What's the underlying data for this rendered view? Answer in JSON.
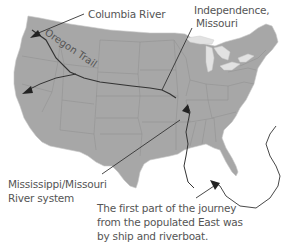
{
  "map": {
    "subject": "Contiguous United States",
    "colors": {
      "land": "#a7a7a7",
      "state_border": "#8e8e8e",
      "lakes": "#e2e2e2",
      "route_line": "#333333",
      "text": "#555555",
      "background": "#ffffff"
    }
  },
  "labels": {
    "columbia_river": "Columbia River",
    "independence_line1": "Independence,",
    "independence_line2": "Missouri",
    "oregon_trail": "Oregon Trail",
    "mississippi_line1": "Mississippi/Missouri",
    "mississippi_line2": "River system",
    "journey_line1": "The first part of the journey",
    "journey_line2": "from the populated East was",
    "journey_line3": "by ship and riverboat."
  }
}
